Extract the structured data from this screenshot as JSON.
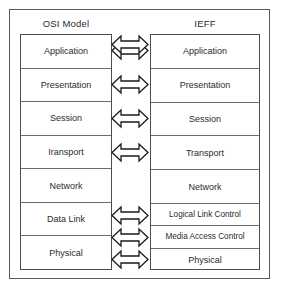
{
  "diagram": {
    "columns": {
      "left": {
        "header": "OSI Model",
        "layers": [
          {
            "label": "Application"
          },
          {
            "label": "Presentation"
          },
          {
            "label": "Session"
          },
          {
            "label": "Iransport"
          },
          {
            "label": "Network"
          },
          {
            "label": "Data Link"
          },
          {
            "label": "Physical"
          }
        ]
      },
      "right": {
        "header": "IEFF",
        "layers": [
          {
            "label": "Application"
          },
          {
            "label": "Presentation"
          },
          {
            "label": "Session"
          },
          {
            "label": "Transport"
          },
          {
            "label": "Network"
          },
          {
            "label": "Logical Link Control"
          },
          {
            "label": "Media Access Control"
          },
          {
            "label": "Physical"
          }
        ]
      }
    },
    "connectors": {
      "icon": "double-headed-arrow-icon",
      "count": 8,
      "description": "Hollow double-headed horizontal arrows linking each OSI layer to its IEFF counterpart"
    },
    "colors": {
      "background": "#ffffff",
      "outer_border": "#595959",
      "box_border": "#4d4d4d",
      "cell_divider": "#6b6b6b",
      "text": "#2b2b2b",
      "arrow_outline": "#1a1a1a",
      "arrow_fill": "#ffffff"
    }
  }
}
